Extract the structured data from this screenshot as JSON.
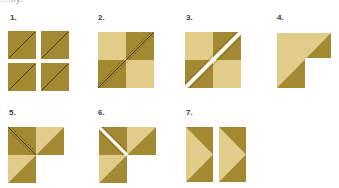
{
  "header": {
    "partial_text": "...lly."
  },
  "colors": {
    "light": "#e2cc8a",
    "dark": "#a38a32",
    "stitch": "#4a3a10",
    "cut": "#ffffff"
  },
  "steps": [
    {
      "number": "1.",
      "description": "four half-square squares with diagonal line"
    },
    {
      "number": "2.",
      "description": "four-patch with diagonal stitching"
    },
    {
      "number": "3.",
      "description": "four-patch cut along diagonal"
    },
    {
      "number": "4.",
      "description": "L-shaped piece split light/dark"
    },
    {
      "number": "5.",
      "description": "three-square L with stitched diagonal"
    },
    {
      "number": "6.",
      "description": "three-square L cut on diagonal"
    },
    {
      "number": "7.",
      "description": "two flying-geese rectangles"
    }
  ]
}
